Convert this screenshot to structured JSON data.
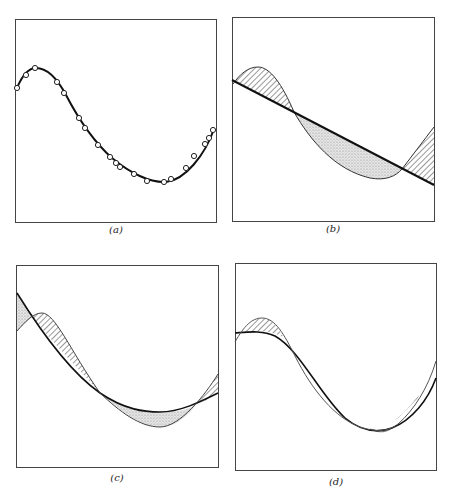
{
  "figure": {
    "panels": [
      {
        "id": "a",
        "label": "(a)",
        "description": "Smooth curve through data points (open circles)"
      },
      {
        "id": "b",
        "label": "(b)",
        "description": "Straight-line approximation; hatched regions above, stippled region below"
      },
      {
        "id": "c",
        "label": "(c)",
        "description": "Quadratic approximation; hatched and stippled error regions"
      },
      {
        "id": "d",
        "label": "(d)",
        "description": "Cubic approximation; small hatched error regions"
      }
    ],
    "colors": {
      "stroke": "#222222",
      "hatch": "#333333",
      "stipple": "#bbbbbb",
      "background": "#ffffff"
    }
  }
}
